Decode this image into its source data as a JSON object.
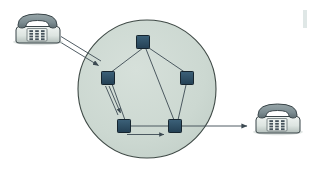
{
  "figure": {
    "description": "Two telephones connected through a cloud-shaped packet switching network containing five interconnected switching nodes.",
    "background_color": "#ffffff"
  },
  "colors": {
    "cloud_fill": "#ccd8d1",
    "cloud_stroke": "#3f4a46",
    "node_fill": "#2d4c61",
    "node_stroke": "#16252f",
    "node_highlight": "#44708c",
    "link_stroke": "#3c4a52",
    "arrow_stroke": "#3c4a52",
    "phone_body_fill": "#dfe6e2",
    "phone_body_shade": "#b6c0bd",
    "phone_handset_fill": "#7f8f93",
    "phone_handset_shade": "#5d6d72",
    "phone_stroke": "#394448",
    "keypad_button_fill": "#44525a",
    "page_mark": "#dfe7e6"
  },
  "cloud": {
    "label": "packet-switching-network",
    "center_x": 147,
    "center_y": 89,
    "radius": 69
  },
  "nodes": [
    {
      "id": "node-top",
      "label": "Node A",
      "x": 143,
      "y": 42,
      "size": 13
    },
    {
      "id": "node-left",
      "label": "Node B",
      "x": 108,
      "y": 78,
      "size": 13
    },
    {
      "id": "node-right",
      "label": "Node C",
      "x": 187,
      "y": 78,
      "size": 13
    },
    {
      "id": "node-bottom-left",
      "label": "Node D",
      "x": 124,
      "y": 126,
      "size": 13
    },
    {
      "id": "node-bottom-right",
      "label": "Node E",
      "x": 175,
      "y": 126,
      "size": 13
    }
  ],
  "links": [
    {
      "id": "link-top-left",
      "from": "node-top",
      "to": "node-left"
    },
    {
      "id": "link-top-right",
      "from": "node-top",
      "to": "node-right"
    },
    {
      "id": "link-top-bottom-right",
      "from": "node-top",
      "to": "node-bottom-right"
    },
    {
      "id": "link-left-bottom-left",
      "from": "node-left",
      "to": "node-bottom-left"
    },
    {
      "id": "link-right-bottom-right",
      "from": "node-right",
      "to": "node-bottom-right"
    },
    {
      "id": "link-bottom",
      "from": "node-bottom-left",
      "to": "node-bottom-right"
    }
  ],
  "phones": [
    {
      "id": "phone-source",
      "label": "Sending telephone",
      "x": 14,
      "y": 12,
      "width": 48,
      "height": 32,
      "keypad_rows": 4,
      "keypad_cols": 3
    },
    {
      "id": "phone-destination",
      "label": "Receiving telephone",
      "x": 255,
      "y": 102,
      "width": 48,
      "height": 32,
      "keypad_rows": 4,
      "keypad_cols": 3
    }
  ],
  "flows": [
    {
      "id": "flow-phone-to-network",
      "label": "Call setup into network",
      "style": "double-line",
      "x1": 62,
      "y1": 41,
      "x2": 104,
      "y2": 66
    },
    {
      "id": "flow-internal-left-down",
      "label": "Routed hop inside network",
      "style": "double-line",
      "x1": 107,
      "y1": 86,
      "x2": 122,
      "y2": 118
    },
    {
      "id": "flow-internal-bottom",
      "label": "Routed hop across bottom",
      "style": "single-line",
      "x1": 128,
      "y1": 134,
      "x2": 168,
      "y2": 134
    },
    {
      "id": "flow-network-to-phone",
      "label": "Delivery to destination telephone",
      "style": "single-line",
      "x1": 182,
      "y1": 126,
      "x2": 252,
      "y2": 126
    }
  ],
  "page_mark": {
    "label": "page-edge-mark",
    "x": 303,
    "y": 10,
    "width": 4,
    "height": 18
  }
}
